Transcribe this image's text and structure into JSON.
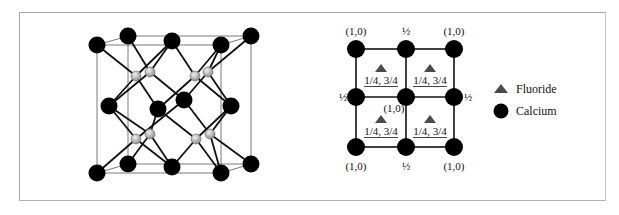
{
  "figure": {
    "left_panel": {
      "title": "Fluorite (CaF2) unit cell, 3D view",
      "calcium_color": "#000000",
      "fluoride_color": "#b8b8b8",
      "bond_color": "#111111",
      "cell_edge_color": "#808080"
    },
    "right_panel": {
      "grid_labels": {
        "top_left": "(1,0)",
        "top_mid": "½",
        "top_right": "(1,0)",
        "mid_left": "½",
        "center": "(1,0)",
        "mid_right": "½",
        "bottom_left": "(1,0)",
        "bottom_mid": "½",
        "bottom_right": "(1,0)"
      },
      "fluoride_labels": [
        "1/4, 3/4",
        "1/4, 3/4",
        "1/4, 3/4",
        "1/4, 3/4"
      ],
      "fluoride_color": "#4a4a4a",
      "calcium_color": "#000000"
    },
    "legend": {
      "items": [
        {
          "label": "Fluoride",
          "symbol": "triangle",
          "color": "#4a4a4a"
        },
        {
          "label": "Calcium",
          "symbol": "circle",
          "color": "#000000"
        }
      ]
    }
  }
}
